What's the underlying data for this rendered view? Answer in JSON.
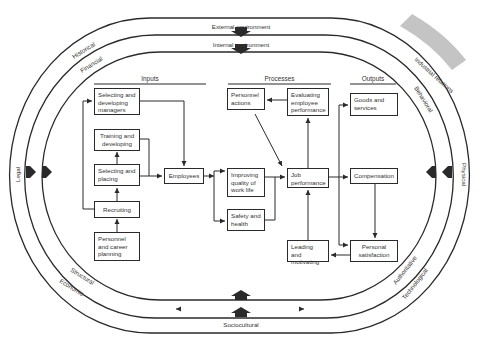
{
  "diagram": {
    "rings": {
      "external_label": "External environment",
      "internal_label": "Internal environment",
      "outer_ring_labels": [
        "Historical",
        "Legal",
        "Economic",
        "Sociocultural",
        "Technological",
        "Physical",
        "Industrial relations"
      ],
      "inner_ring_labels": [
        "Financial",
        "Structural",
        "Authoritative",
        "Behavioral"
      ]
    },
    "columns": {
      "inputs": "Inputs",
      "processes": "Processes",
      "outputs": "Outputs"
    },
    "boxes": {
      "selecting_developing_managers": "Selecting and developing managers",
      "training_developing": "Training and developing",
      "selecting_placing": "Selecting and placing",
      "recruiting": "Recruiting",
      "personnel_career_planning": "Personnel and career planning",
      "employees": "Employees",
      "improving_quality": "Improving quality of work life",
      "safety_health": "Safety and health",
      "personnel_actions": "Personnel actions",
      "evaluating_performance": "Evaluating employee performance",
      "job_performance": "Job performance",
      "leading_motivating": "Leading and motivating",
      "goods_services": "Goods and services",
      "compensation": "Compensation",
      "personal_satisfaction": "Personal satisfaction"
    },
    "colors": {
      "line": "#2a2a2a",
      "highlight_band": "#bdbdbd"
    }
  }
}
